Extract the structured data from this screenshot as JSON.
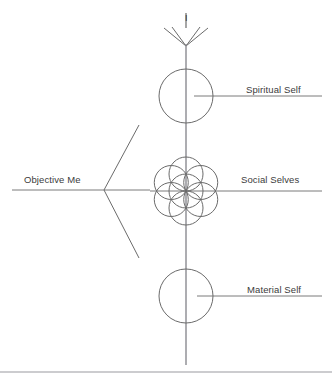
{
  "diagram": {
    "title_label_i": "I",
    "labels": {
      "spiritual_self": "Spiritual Self",
      "social_selves": "Social Selves",
      "material_self": "Material Self",
      "objective_me": "Objective Me"
    },
    "colors": {
      "stroke": "#6b6b6b",
      "text": "#3b3b3b",
      "rule": "#9a9aa0",
      "background": "#ffffff"
    },
    "geometry": {
      "axis": {
        "x": 186,
        "y_top": 36,
        "y_bottom": 365
      },
      "fan": {
        "apex_x": 186,
        "apex_y": 46,
        "tips": [
          {
            "x": 164,
            "y": 28
          },
          {
            "x": 172,
            "y": 27
          },
          {
            "x": 200,
            "y": 27
          },
          {
            "x": 208,
            "y": 28
          }
        ]
      },
      "i_stem": {
        "x": 186,
        "y_top": 13,
        "y_bottom": 28
      },
      "circles": {
        "spiritual_self": {
          "cx": 186,
          "cy": 96,
          "r": 27
        },
        "material_self": {
          "cx": 186,
          "cy": 296,
          "r": 27
        },
        "social_cluster": {
          "cx": 186,
          "cy": 191,
          "petal_r": 17,
          "petal_offset": 17,
          "count": 6
        }
      },
      "leaders": {
        "spiritual_self": {
          "x1": 194,
          "y1": 96,
          "x2": 322,
          "y2": 96
        },
        "social_selves": {
          "x1": 150,
          "y1": 191,
          "x2": 322,
          "y2": 191
        },
        "material_self": {
          "x1": 197,
          "y1": 296,
          "x2": 322,
          "y2": 296
        },
        "objective_me": {
          "x1": 12,
          "y1": 190,
          "x2": 150,
          "y2": 190
        }
      },
      "arrow_v": {
        "vertex": {
          "x": 104,
          "y": 190
        },
        "upper_tip": {
          "x": 139,
          "y": 125
        },
        "lower_tip": {
          "x": 139,
          "y": 258
        }
      },
      "bottom_rule": {
        "x1": 0,
        "y1": 372,
        "x2": 332,
        "y2": 372
      }
    }
  }
}
